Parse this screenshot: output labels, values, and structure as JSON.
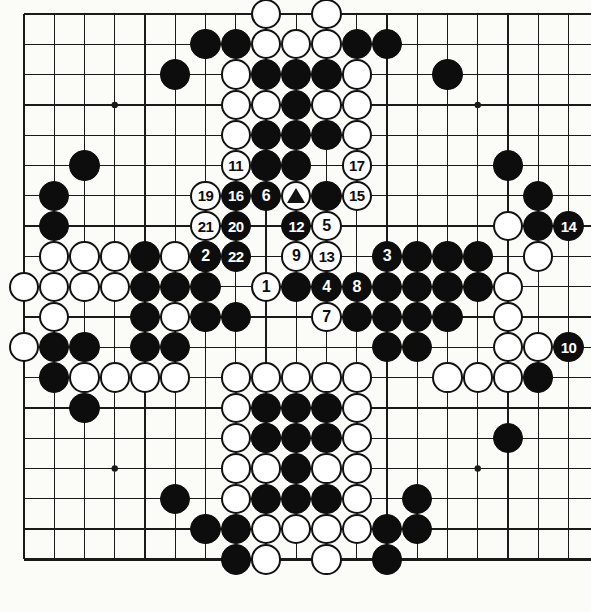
{
  "diagram": {
    "type": "go-board-diagram",
    "board_size": 19,
    "view": {
      "origin_x": 24,
      "origin_y": 14,
      "spacing_x": 30.25,
      "spacing_y": 30.3,
      "cols_visible": 19,
      "rows_visible": 19,
      "edges_drawn": {
        "top": true,
        "left": true,
        "bottom": true,
        "right": false
      }
    },
    "colors": {
      "board": "#fbfbf8",
      "line": "#1a1a1a",
      "black_stone": "#0d0d0d",
      "white_stone": "#ffffff",
      "white_outline": "#111111",
      "label_on_black": "#ffffff",
      "label_on_white": "#0d0d0d"
    },
    "star_points": [
      {
        "c": 3,
        "r": 3
      },
      {
        "c": 15,
        "r": 3
      },
      {
        "c": 3,
        "r": 15
      },
      {
        "c": 15,
        "r": 15
      },
      {
        "c": 9,
        "r": 9
      }
    ],
    "marks": [
      {
        "c": 9,
        "r": 6,
        "color": "white",
        "mark": "triangle"
      }
    ],
    "move_numbers": [
      {
        "n": "1",
        "color": "white",
        "c": 8,
        "r": 9
      },
      {
        "n": "2",
        "color": "black",
        "c": 6,
        "r": 8
      },
      {
        "n": "3",
        "color": "black",
        "c": 12,
        "r": 8
      },
      {
        "n": "4",
        "color": "black",
        "c": 10,
        "r": 9
      },
      {
        "n": "5",
        "color": "white",
        "c": 10,
        "r": 7
      },
      {
        "n": "6",
        "color": "black",
        "c": 8,
        "r": 6
      },
      {
        "n": "7",
        "color": "white",
        "c": 10,
        "r": 10
      },
      {
        "n": "8",
        "color": "black",
        "c": 11,
        "r": 9
      },
      {
        "n": "9",
        "color": "white",
        "c": 9,
        "r": 8
      },
      {
        "n": "10",
        "color": "black",
        "c": 18,
        "r": 11
      },
      {
        "n": "11",
        "color": "white",
        "c": 7,
        "r": 5
      },
      {
        "n": "12",
        "color": "black",
        "c": 9,
        "r": 7
      },
      {
        "n": "13",
        "color": "white",
        "c": 10,
        "r": 8
      },
      {
        "n": "14",
        "color": "black",
        "c": 18,
        "r": 7
      },
      {
        "n": "15",
        "color": "white",
        "c": 11,
        "r": 6
      },
      {
        "n": "16",
        "color": "black",
        "c": 7,
        "r": 6
      },
      {
        "n": "17",
        "color": "white",
        "c": 11,
        "r": 5
      },
      {
        "n": "19",
        "color": "white",
        "c": 6,
        "r": 6
      },
      {
        "n": "20",
        "color": "black",
        "c": 7,
        "r": 7
      },
      {
        "n": "21",
        "color": "white",
        "c": 6,
        "r": 7
      },
      {
        "n": "22",
        "color": "black",
        "c": 7,
        "r": 8
      }
    ],
    "black_stones": [
      {
        "c": 6,
        "r": 1
      },
      {
        "c": 7,
        "r": 1
      },
      {
        "c": 11,
        "r": 1
      },
      {
        "c": 12,
        "r": 1
      },
      {
        "c": 5,
        "r": 2
      },
      {
        "c": 8,
        "r": 2
      },
      {
        "c": 9,
        "r": 2
      },
      {
        "c": 10,
        "r": 2
      },
      {
        "c": 14,
        "r": 2
      },
      {
        "c": 9,
        "r": 3
      },
      {
        "c": 8,
        "r": 4
      },
      {
        "c": 9,
        "r": 4
      },
      {
        "c": 10,
        "r": 4
      },
      {
        "c": 2,
        "r": 5
      },
      {
        "c": 8,
        "r": 5
      },
      {
        "c": 9,
        "r": 5
      },
      {
        "c": 16,
        "r": 5
      },
      {
        "c": 1,
        "r": 6
      },
      {
        "c": 10,
        "r": 6
      },
      {
        "c": 17,
        "r": 6
      },
      {
        "c": 1,
        "r": 7
      },
      {
        "c": 17,
        "r": 7
      },
      {
        "c": 4,
        "r": 8
      },
      {
        "c": 6,
        "r": 8
      },
      {
        "c": 13,
        "r": 8
      },
      {
        "c": 14,
        "r": 8
      },
      {
        "c": 15,
        "r": 8
      },
      {
        "c": 4,
        "r": 9
      },
      {
        "c": 5,
        "r": 9
      },
      {
        "c": 6,
        "r": 9
      },
      {
        "c": 9,
        "r": 9
      },
      {
        "c": 12,
        "r": 9
      },
      {
        "c": 13,
        "r": 9
      },
      {
        "c": 14,
        "r": 9
      },
      {
        "c": 15,
        "r": 9
      },
      {
        "c": 4,
        "r": 10
      },
      {
        "c": 6,
        "r": 10
      },
      {
        "c": 7,
        "r": 10
      },
      {
        "c": 11,
        "r": 10
      },
      {
        "c": 12,
        "r": 10
      },
      {
        "c": 13,
        "r": 10
      },
      {
        "c": 14,
        "r": 10
      },
      {
        "c": 1,
        "r": 11
      },
      {
        "c": 2,
        "r": 11
      },
      {
        "c": 4,
        "r": 11
      },
      {
        "c": 5,
        "r": 11
      },
      {
        "c": 12,
        "r": 11
      },
      {
        "c": 13,
        "r": 11
      },
      {
        "c": 1,
        "r": 12
      },
      {
        "c": 17,
        "r": 12
      },
      {
        "c": 2,
        "r": 13
      },
      {
        "c": 8,
        "r": 13
      },
      {
        "c": 9,
        "r": 13
      },
      {
        "c": 10,
        "r": 13
      },
      {
        "c": 8,
        "r": 14
      },
      {
        "c": 9,
        "r": 14
      },
      {
        "c": 10,
        "r": 14
      },
      {
        "c": 16,
        "r": 14
      },
      {
        "c": 9,
        "r": 15
      },
      {
        "c": 5,
        "r": 16
      },
      {
        "c": 8,
        "r": 16
      },
      {
        "c": 9,
        "r": 16
      },
      {
        "c": 10,
        "r": 16
      },
      {
        "c": 13,
        "r": 16
      },
      {
        "c": 6,
        "r": 17
      },
      {
        "c": 7,
        "r": 17
      },
      {
        "c": 12,
        "r": 17
      },
      {
        "c": 13,
        "r": 17
      },
      {
        "c": 7,
        "r": 18
      },
      {
        "c": 12,
        "r": 18
      }
    ],
    "white_stones": [
      {
        "c": 8,
        "r": 0
      },
      {
        "c": 10,
        "r": 0
      },
      {
        "c": 8,
        "r": 1
      },
      {
        "c": 9,
        "r": 1
      },
      {
        "c": 10,
        "r": 1
      },
      {
        "c": 7,
        "r": 2
      },
      {
        "c": 11,
        "r": 2
      },
      {
        "c": 7,
        "r": 3
      },
      {
        "c": 8,
        "r": 3
      },
      {
        "c": 10,
        "r": 3
      },
      {
        "c": 11,
        "r": 3
      },
      {
        "c": 7,
        "r": 4
      },
      {
        "c": 11,
        "r": 4
      },
      {
        "c": 8,
        "r": 5
      },
      {
        "c": 16,
        "r": 7
      },
      {
        "c": 17,
        "r": 8
      },
      {
        "c": 1,
        "r": 8
      },
      {
        "c": 2,
        "r": 8
      },
      {
        "c": 3,
        "r": 8
      },
      {
        "c": 5,
        "r": 8
      },
      {
        "c": 0,
        "r": 9
      },
      {
        "c": 1,
        "r": 9
      },
      {
        "c": 2,
        "r": 9
      },
      {
        "c": 3,
        "r": 9
      },
      {
        "c": 16,
        "r": 9
      },
      {
        "c": 1,
        "r": 10
      },
      {
        "c": 5,
        "r": 10
      },
      {
        "c": 16,
        "r": 10
      },
      {
        "c": 0,
        "r": 11
      },
      {
        "c": 16,
        "r": 11
      },
      {
        "c": 17,
        "r": 11
      },
      {
        "c": 2,
        "r": 12
      },
      {
        "c": 3,
        "r": 12
      },
      {
        "c": 4,
        "r": 12
      },
      {
        "c": 5,
        "r": 12
      },
      {
        "c": 14,
        "r": 12
      },
      {
        "c": 15,
        "r": 12
      },
      {
        "c": 16,
        "r": 12
      },
      {
        "c": 7,
        "r": 12
      },
      {
        "c": 8,
        "r": 12
      },
      {
        "c": 9,
        "r": 12
      },
      {
        "c": 10,
        "r": 12
      },
      {
        "c": 11,
        "r": 12
      },
      {
        "c": 7,
        "r": 13
      },
      {
        "c": 11,
        "r": 13
      },
      {
        "c": 7,
        "r": 14
      },
      {
        "c": 8,
        "r": 14
      },
      {
        "c": 11,
        "r": 14
      },
      {
        "c": 7,
        "r": 15
      },
      {
        "c": 11,
        "r": 15
      },
      {
        "c": 8,
        "r": 15
      },
      {
        "c": 10,
        "r": 15
      },
      {
        "c": 7,
        "r": 16
      },
      {
        "c": 11,
        "r": 16
      },
      {
        "c": 8,
        "r": 17
      },
      {
        "c": 9,
        "r": 17
      },
      {
        "c": 10,
        "r": 17
      },
      {
        "c": 11,
        "r": 17
      },
      {
        "c": 8,
        "r": 18
      },
      {
        "c": 10,
        "r": 18
      }
    ]
  }
}
